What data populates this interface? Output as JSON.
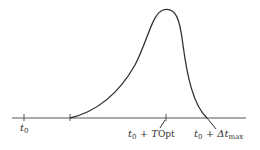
{
  "diagram": {
    "type": "time-response curve",
    "axis": {
      "y": 118,
      "x_start": 12,
      "x_end": 246,
      "color": "#555555"
    },
    "curve": {
      "color": "#333333",
      "start_x": 70,
      "peak_x": 165,
      "peak_y": 10,
      "end_x": 207
    },
    "labels": {
      "t0": {
        "main": "t",
        "sub": "0"
      },
      "t_opt": {
        "main": "t",
        "sub": "0",
        "plus": " + ",
        "var": "T",
        "var_sub": "Opt"
      },
      "t_max": {
        "main": "t",
        "sub": "0",
        "plus": " + ",
        "var": "Δt",
        "var_sub": "max"
      }
    }
  }
}
